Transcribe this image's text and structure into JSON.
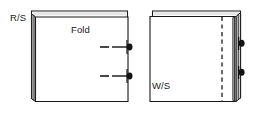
{
  "figure": {
    "type": "line-drawing",
    "width": 259,
    "height": 115,
    "background_color": "#ffffff",
    "line_color": "#1a1a1a",
    "fill_color": "#ffffff",
    "shade_color": "#9a9a9a",
    "pin_color": "#141414"
  },
  "labels": {
    "right_side": "R/S",
    "fold": "Fold",
    "wrong_side": "W/S"
  },
  "panels": [
    {
      "id": "left-panel",
      "name": "folded-fabric-front-view",
      "face_label": "R/S",
      "fold_label": "Fold",
      "fold_edge": "left",
      "pin_count": 2,
      "pins": [
        {
          "index": 1,
          "y": 47,
          "marker": "tick-dash-pin"
        },
        {
          "index": 2,
          "y": 76,
          "marker": "tick-dash-pin"
        }
      ]
    },
    {
      "id": "right-panel",
      "name": "folded-fabric-back-view",
      "face_label": "W/S",
      "stitch_line": "dashed-vertical",
      "fold_edge": "right",
      "pin_count": 2,
      "pins": [
        {
          "index": 1,
          "y": 43,
          "marker": "pin"
        },
        {
          "index": 2,
          "y": 72,
          "marker": "pin"
        }
      ]
    }
  ]
}
